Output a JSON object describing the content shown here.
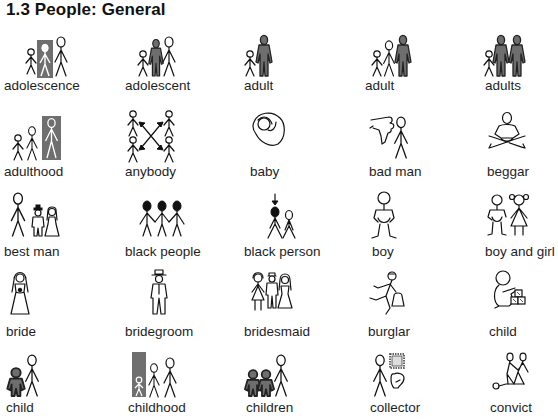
{
  "page": {
    "title": "1.3 People: General"
  },
  "symbols": [
    {
      "label": "adolescence",
      "icon": "adolescence-icon"
    },
    {
      "label": "adolescent",
      "icon": "adolescent-icon"
    },
    {
      "label": "adult",
      "icon": "adult-icon"
    },
    {
      "label": "adult",
      "icon": "adult-alt-icon"
    },
    {
      "label": "adults",
      "icon": "adults-icon"
    },
    {
      "label": "adulthood",
      "icon": "adulthood-icon"
    },
    {
      "label": "anybody",
      "icon": "anybody-icon"
    },
    {
      "label": "baby",
      "icon": "baby-icon"
    },
    {
      "label": "bad man",
      "icon": "bad-man-icon"
    },
    {
      "label": "beggar",
      "icon": "beggar-icon"
    },
    {
      "label": "best man",
      "icon": "best-man-icon"
    },
    {
      "label": "black people",
      "icon": "black-people-icon"
    },
    {
      "label": "black person",
      "icon": "black-person-icon"
    },
    {
      "label": "boy",
      "icon": "boy-icon"
    },
    {
      "label": "boy and girl",
      "icon": "boy-and-girl-icon"
    },
    {
      "label": "bride",
      "icon": "bride-icon"
    },
    {
      "label": "bridegroom",
      "icon": "bridegroom-icon"
    },
    {
      "label": "bridesmaid",
      "icon": "bridesmaid-icon"
    },
    {
      "label": "burglar",
      "icon": "burglar-icon"
    },
    {
      "label": "child",
      "icon": "child-toddler-icon"
    },
    {
      "label": "child",
      "icon": "child-icon"
    },
    {
      "label": "childhood",
      "icon": "childhood-icon"
    },
    {
      "label": "children",
      "icon": "children-icon"
    },
    {
      "label": "collector",
      "icon": "collector-icon"
    },
    {
      "label": "convict",
      "icon": "convict-icon"
    }
  ]
}
